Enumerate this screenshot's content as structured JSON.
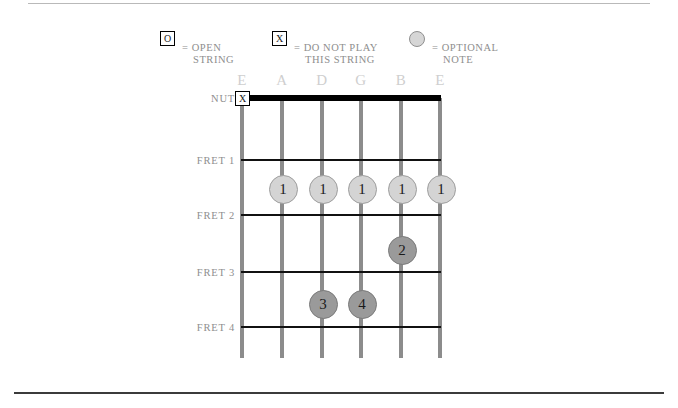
{
  "legend": {
    "items": [
      {
        "glyph": "O",
        "glyph_kind": "boxed-letter",
        "name": "open-string",
        "line1": "= OPEN",
        "line2": "STRING"
      },
      {
        "glyph": "X",
        "glyph_kind": "boxed-letter",
        "name": "do-not-play-string",
        "line1": "= DO NOT PLAY",
        "line2": "THIS STRING"
      },
      {
        "glyph": "",
        "glyph_kind": "circle",
        "name": "optional-note",
        "line1": "= OPTIONAL",
        "line2": "NOTE"
      }
    ]
  },
  "diagram": {
    "nut_label": "NUT",
    "fret_labels": [
      "FRET 1",
      "FRET 2",
      "FRET 3",
      "FRET 4"
    ],
    "string_labels": [
      "E",
      "A",
      "D",
      "G",
      "B",
      "E"
    ],
    "markers": {
      "mute": "X",
      "fingers": [
        "1",
        "1",
        "1",
        "1",
        "1",
        "2",
        "3",
        "4"
      ]
    }
  },
  "chord_data": {
    "type": "chord-diagram",
    "instrument": "guitar",
    "strings": [
      "E",
      "A",
      "D",
      "G",
      "B",
      "E"
    ],
    "frets_shown": [
      1,
      2,
      3,
      4
    ],
    "positions": [
      {
        "string": "E",
        "string_index": 0,
        "fret": 0,
        "marker": "X",
        "meaning": "do not play"
      },
      {
        "string": "A",
        "string_index": 1,
        "fret": 1,
        "finger": "1",
        "style": "optional"
      },
      {
        "string": "D",
        "string_index": 2,
        "fret": 1,
        "finger": "1",
        "style": "optional"
      },
      {
        "string": "G",
        "string_index": 3,
        "fret": 1,
        "finger": "1",
        "style": "optional"
      },
      {
        "string": "B",
        "string_index": 4,
        "fret": 1,
        "finger": "1",
        "style": "optional"
      },
      {
        "string": "E",
        "string_index": 5,
        "fret": 1,
        "finger": "1",
        "style": "optional"
      },
      {
        "string": "B",
        "string_index": 4,
        "fret": 2,
        "finger": "2",
        "style": "fretted"
      },
      {
        "string": "D",
        "string_index": 2,
        "fret": 3,
        "finger": "3",
        "style": "fretted"
      },
      {
        "string": "G",
        "string_index": 3,
        "fret": 3,
        "finger": "4",
        "style": "fretted"
      }
    ]
  },
  "colors": {
    "string": "#8c8c8c",
    "fret": "#111111",
    "label": "#8e8e8e",
    "string_label": "#cfcfcf",
    "dot_light": "#d4d4d4",
    "dot_dark": "#9a9a9a"
  }
}
